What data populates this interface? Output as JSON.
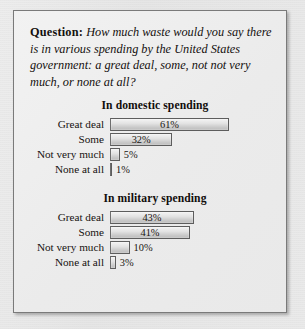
{
  "question": {
    "label": "Question:",
    "text": "How much waste would you say there is in various spending by the United States government: a great deal, some, not not very much, or none at all?"
  },
  "chart_data": {
    "type": "bar",
    "title": "How much waste would you say there is in various spending by the United States government: a great deal, some, not not very much, or none at all?",
    "orientation": "horizontal",
    "categories": [
      "Great deal",
      "Some",
      "Not very much",
      "None at all"
    ],
    "xlabel": "",
    "ylabel": "",
    "xlim": [
      0,
      100
    ],
    "grid": false,
    "legend": "none",
    "value_suffix": "%",
    "panels": [
      {
        "title": "In domestic spending",
        "categories": [
          "Great deal",
          "Some",
          "Not very much",
          "None at all"
        ],
        "values": [
          61,
          32,
          5,
          1
        ],
        "labels": [
          "61%",
          "32%",
          "5%",
          "1%"
        ]
      },
      {
        "title": "In military spending",
        "categories": [
          "Great deal",
          "Some",
          "Not very much",
          "None at all"
        ],
        "values": [
          43,
          41,
          10,
          3
        ],
        "labels": [
          "43%",
          "41%",
          "10%",
          "3%"
        ]
      }
    ]
  },
  "style": {
    "bar_border": "#5d5d5d",
    "panel_border": "#7a7a7a",
    "text_color": "#14100e"
  }
}
